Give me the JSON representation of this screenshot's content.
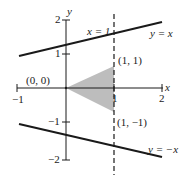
{
  "diagram": {
    "type": "coordinate-plot",
    "axes": {
      "x_label": "x",
      "y_label": "y",
      "x_ticks": [
        "-1",
        "1",
        "2"
      ],
      "y_ticks": [
        "2",
        "1",
        "-1",
        "-2"
      ],
      "x_range": [
        -1,
        2
      ],
      "y_range": [
        -2,
        2
      ]
    },
    "lines": [
      {
        "label": "y = x",
        "style": "solid",
        "from": [
          -1,
          1
        ],
        "to": [
          2,
          2
        ]
      },
      {
        "label": "y = -x",
        "style": "solid",
        "from": [
          -1,
          -1
        ],
        "to": [
          2,
          -2
        ]
      },
      {
        "label": "x = 1",
        "style": "dashed"
      }
    ],
    "points": [
      {
        "label": "(0, 0)"
      },
      {
        "label": "(1, 1)"
      },
      {
        "label": "(1, −1)"
      }
    ],
    "labels": {
      "x_axis": "x",
      "y_axis": "y",
      "tick_x_neg1": "−1",
      "tick_x_1": "1",
      "tick_x_2": "2",
      "tick_y_2": "2",
      "tick_y_1": "1",
      "tick_y_neg1": "−1",
      "tick_y_neg2": "−2",
      "line_vertical": "x = 1",
      "line_y_eq_x": "y = x",
      "line_y_eq_neg_x": "y = −x",
      "point_origin": "(0, 0)",
      "point_upper": "(1, 1)",
      "point_lower": "(1, −1)"
    },
    "colors": {
      "ink": "#1a1a1a",
      "shade": "#bdbdbd",
      "background": "#ffffff"
    }
  }
}
